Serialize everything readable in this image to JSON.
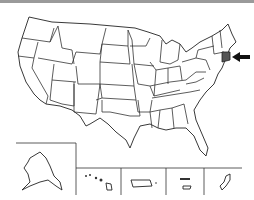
{
  "map": {
    "title": "United States outline map",
    "highlighted_state": "Connecticut",
    "highlight_color": "#555555",
    "outline_color": "#222222",
    "background": "#ffffff",
    "marker": "arrow-pointing-left",
    "insets": [
      "Alaska",
      "Hawaii",
      "Puerto Rico",
      "U.S. Virgin Islands",
      "Guam"
    ]
  }
}
